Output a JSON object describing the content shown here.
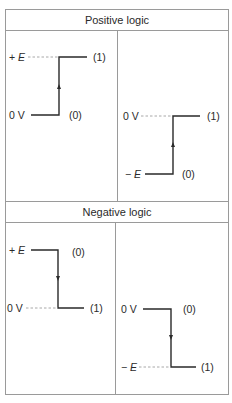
{
  "table": {
    "sections": [
      {
        "title": "Positive logic",
        "panels": [
          {
            "high_label_prefix": "+ ",
            "high_label_var": "E",
            "low_label": "0 V",
            "high_state": "(1)",
            "low_state": "(0)",
            "transition": "rising"
          },
          {
            "high_label": "0 V",
            "low_label_prefix": "− ",
            "low_label_var": "E",
            "high_state": "(1)",
            "low_state": "(0)",
            "transition": "rising"
          }
        ]
      },
      {
        "title": "Negative logic",
        "panels": [
          {
            "high_label_prefix": "+ ",
            "high_label_var": "E",
            "low_label": "0 V",
            "high_state": "(0)",
            "low_state": "(1)",
            "transition": "falling"
          },
          {
            "high_label": "0 V",
            "low_label_prefix": "− ",
            "low_label_var": "E",
            "high_state": "(0)",
            "low_state": "(1)",
            "transition": "falling"
          }
        ]
      }
    ]
  },
  "colors": {
    "border": "#9a9a9a",
    "signal": "#2a2a2a",
    "reference_dash": "#a8a8a8"
  }
}
